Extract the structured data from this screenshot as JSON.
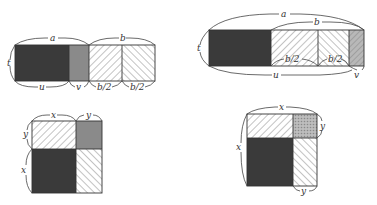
{
  "colors": {
    "dark": "#3a3a3a",
    "gray": "#8a8a8a",
    "hatch_bg": "#ffffff",
    "hatch_line": "#666666",
    "crosshatch_bg": "#b0b0b0",
    "line": "#333333"
  },
  "diagrams": [
    {
      "id": "top-left",
      "regions": [
        "dark rectangle u×t",
        "gray rectangle v×t",
        "hatched b/2×t",
        "hatched b/2×t"
      ],
      "labels": {
        "a": "a",
        "b": "b",
        "t": "t",
        "u": "u",
        "v": "v",
        "half_b_1": "b/2",
        "half_b_2": "b/2"
      }
    },
    {
      "id": "top-right",
      "regions": [
        "dark rectangle",
        "hatched b/2",
        "hatched b/2",
        "gray hatched v"
      ],
      "labels": {
        "a": "a",
        "b": "b",
        "t": "t",
        "u": "u",
        "v": "v",
        "half_b_1": "b/2",
        "half_b_2": "b/2"
      }
    },
    {
      "id": "bottom-left",
      "regions": [
        "hatched x×y",
        "gray y×y",
        "dark x×x",
        "hatched y×x"
      ],
      "labels": {
        "x_top": "x",
        "y_top": "y",
        "y_left": "y",
        "x_left": "x"
      }
    },
    {
      "id": "bottom-right",
      "regions": [
        "hatched",
        "crosshatch y×y",
        "dark",
        "hatched"
      ],
      "labels": {
        "x_top": "x",
        "y_right": "y",
        "x_left": "x",
        "y_bottom": "y"
      }
    }
  ]
}
